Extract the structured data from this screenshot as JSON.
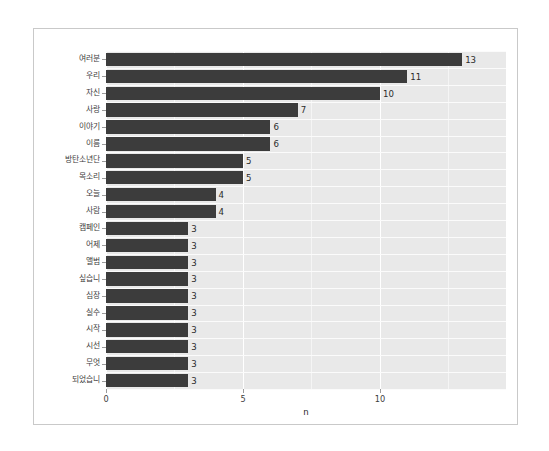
{
  "chart_data": {
    "type": "bar",
    "orientation": "horizontal",
    "title": "",
    "subtitle": "",
    "xlabel": "n",
    "ylabel": "",
    "xlim": [
      0,
      14.6
    ],
    "x_ticks": [
      0,
      5,
      10
    ],
    "x_tick_labels": [
      "0",
      "5",
      "10"
    ],
    "x_minor_ticks": [
      2.5,
      7.5,
      12.5
    ],
    "grid": "vertical-white-on-grey-panel",
    "legend": "none",
    "bar_color": "#3c3c3c",
    "panel_color": "#e9e9e9",
    "gridline_color": "#ffffff",
    "categories": [
      "여러분",
      "우리",
      "자신",
      "사랑",
      "이야기",
      "이름",
      "방탄소년단",
      "목소리",
      "오늘",
      "사람",
      "캠페인",
      "어제",
      "앨범",
      "싶습니",
      "심장",
      "실수",
      "시작",
      "시선",
      "무엇",
      "되었습니"
    ],
    "values": [
      13,
      11,
      10,
      7,
      6,
      6,
      5,
      5,
      4,
      4,
      3,
      3,
      3,
      3,
      3,
      3,
      3,
      3,
      3,
      3
    ],
    "value_labels": [
      "13",
      "11",
      "10",
      "7",
      "6",
      "6",
      "5",
      "5",
      "4",
      "4",
      "3",
      "3",
      "3",
      "3",
      "3",
      "3",
      "3",
      "3",
      "3",
      "3"
    ]
  }
}
